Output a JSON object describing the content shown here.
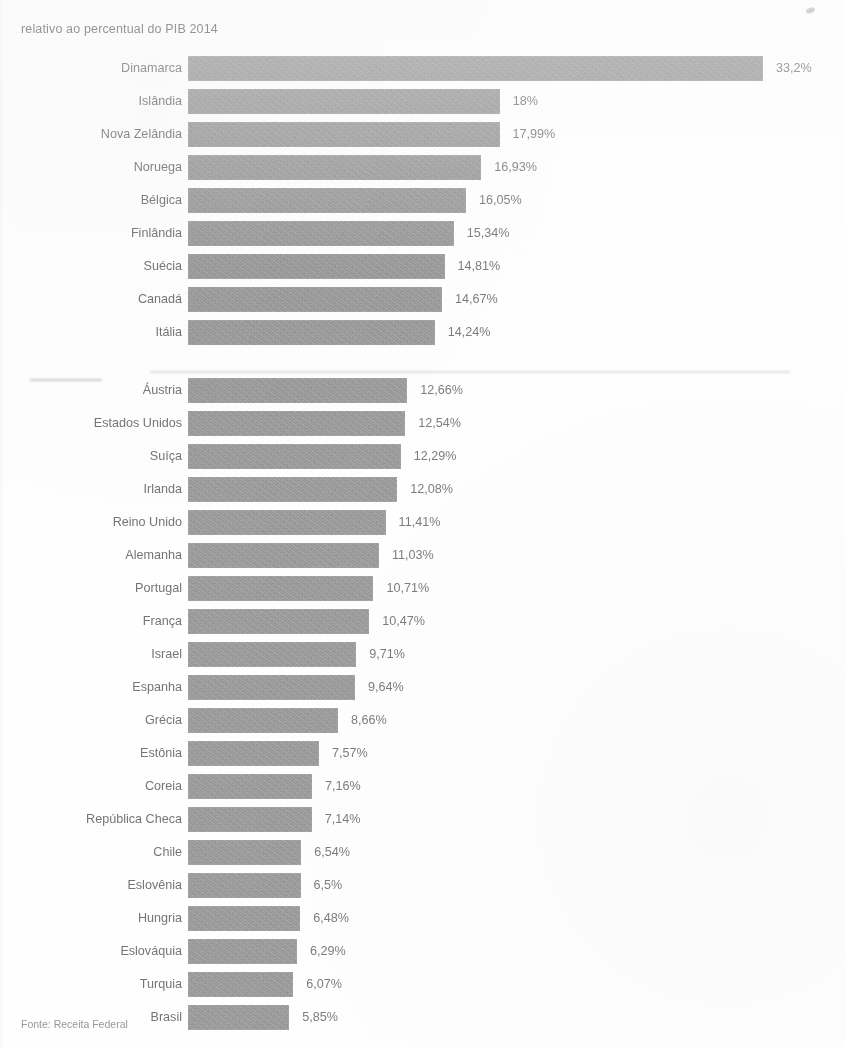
{
  "title": "relativo ao percentual do PIB 2014",
  "source_note": "Fonte: Receita Federal",
  "chart_data": {
    "type": "bar",
    "orientation": "horizontal",
    "title": "relativo ao percentual do PIB 2014",
    "xlabel": "",
    "ylabel": "",
    "xlim": [
      0,
      33.2
    ],
    "grid": false,
    "legend": null,
    "value_suffix": "%",
    "decimal_separator": ",",
    "categories": [
      "Dinamarca",
      "Islândia",
      "Nova Zelândia",
      "Noruega",
      "Bélgica",
      "Finlândia",
      "Suécia",
      "Canadá",
      "Itália",
      "Áustria",
      "Estados Unidos",
      "Suíça",
      "Irlanda",
      "Reino Unido",
      "Alemanha",
      "Portugal",
      "França",
      "Israel",
      "Espanha",
      "Grécia",
      "Estônia",
      "Coreia",
      "República Checa",
      "Chile",
      "Eslovênia",
      "Hungria",
      "Eslováquia",
      "Turquia",
      "Brasil"
    ],
    "values": [
      33.2,
      18,
      17.99,
      16.93,
      16.05,
      15.34,
      14.81,
      14.67,
      14.24,
      12.66,
      12.54,
      12.29,
      12.08,
      11.41,
      11.03,
      10.71,
      10.47,
      9.71,
      9.64,
      8.66,
      7.57,
      7.16,
      7.14,
      6.54,
      6.5,
      6.48,
      6.29,
      6.07,
      5.85
    ],
    "value_labels": [
      "33,2%",
      "18%",
      "17,99%",
      "16,93%",
      "16,05%",
      "15,34%",
      "14,81%",
      "14,67%",
      "14,24%",
      "12,66%",
      "12,54%",
      "12,29%",
      "12,08%",
      "11,41%",
      "11,03%",
      "10,71%",
      "10,47%",
      "9,71%",
      "9,64%",
      "8,66%",
      "7,57%",
      "7,16%",
      "7,14%",
      "6,54%",
      "6,5%",
      "6,48%",
      "6,29%",
      "6,07%",
      "5,85%"
    ],
    "group_break_after_index": 8,
    "bar_color": "#9b9b9b",
    "label_color": "#6e6e6e",
    "value_color": "#767676",
    "background_color": "#ffffff",
    "px_per_unit": 17.32,
    "bar_origin_x": 188
  }
}
